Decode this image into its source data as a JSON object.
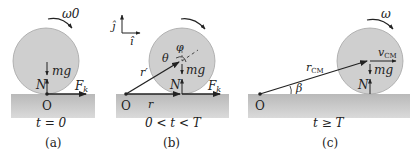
{
  "colors": {
    "disk_fill": "#cfcfcf",
    "disk_stroke": "#9a9a9a",
    "ground_top": "#bdbdbd",
    "ground_bottom": "#d6d6d6",
    "ink": "#222222"
  },
  "panels": [
    {
      "id": "a",
      "caption": "(a)",
      "time_label": "t = 0",
      "omega_label": "ω0",
      "origin_label": "O",
      "normal_label": "N",
      "weight_label": "mg",
      "friction_label": "Fk"
    },
    {
      "id": "b",
      "caption": "(b)",
      "time_label": "0 < t < T",
      "axis_j": "ĵ",
      "axis_i": "î",
      "theta_label": "θ",
      "phi_label": "φ",
      "r_prime_label": "r′",
      "r_label": "r",
      "origin_label": "O",
      "normal_label": "N",
      "weight_label": "mg",
      "friction_label": "Fk"
    },
    {
      "id": "c",
      "caption": "(c)",
      "time_label": "t ≥ T",
      "omega_label": "ω",
      "vcm_label": "vCM",
      "rcm_label": "rCM",
      "beta_label": "β",
      "origin_label": "O",
      "normal_label": "N",
      "weight_label": "mg"
    }
  ]
}
